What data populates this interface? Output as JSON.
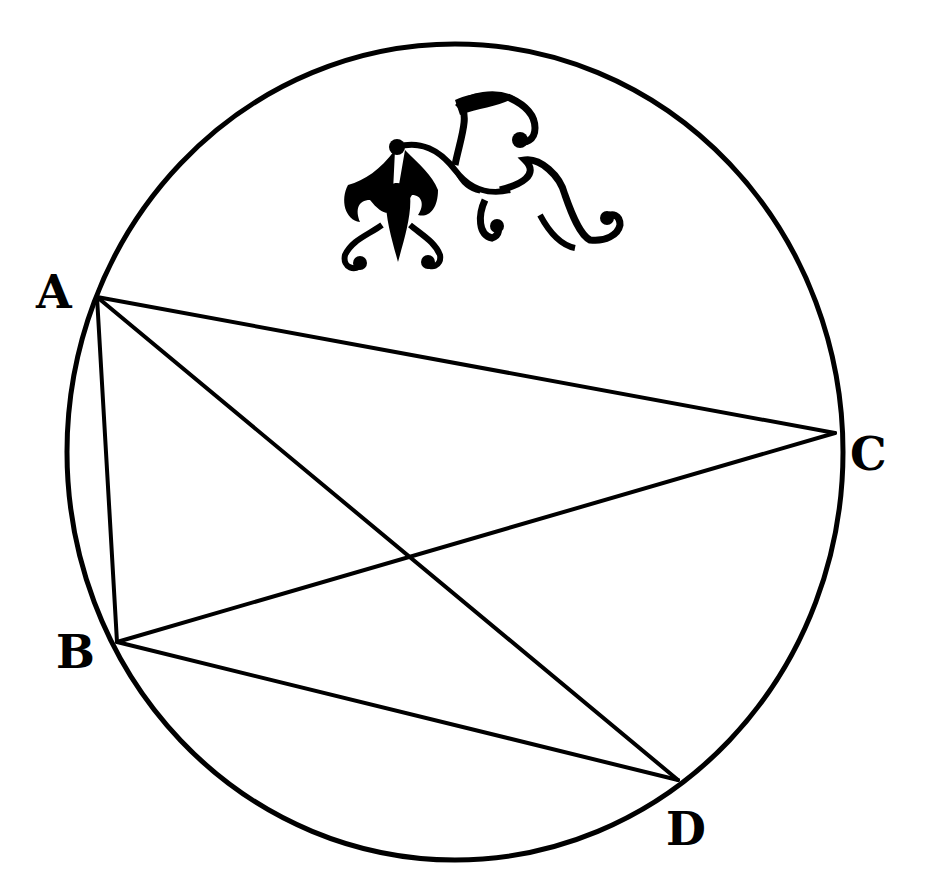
{
  "diagram": {
    "type": "cyclic-quadrilateral",
    "colors": {
      "background": "#ffffff",
      "ink": "#000000"
    },
    "circle": {
      "cx": 455,
      "cy": 452,
      "rx": 388,
      "ry": 408
    },
    "points": {
      "A": {
        "label": "A",
        "x": 97,
        "y": 297,
        "label_x": 36,
        "label_y": 308
      },
      "B": {
        "label": "B",
        "x": 117,
        "y": 642,
        "label_x": 56,
        "label_y": 668
      },
      "C": {
        "label": "C",
        "x": 835,
        "y": 433,
        "label_x": 850,
        "label_y": 470
      },
      "D": {
        "label": "D",
        "x": 678,
        "y": 780,
        "label_x": 666,
        "label_y": 845
      }
    },
    "segments": [
      {
        "name": "AC",
        "from": "A",
        "to": "C"
      },
      {
        "name": "AB",
        "from": "A",
        "to": "B"
      },
      {
        "name": "AD",
        "from": "A",
        "to": "D"
      },
      {
        "name": "BC",
        "from": "B",
        "to": "C"
      },
      {
        "name": "BD",
        "from": "B",
        "to": "D"
      }
    ],
    "ornament": {
      "name": "floral-vignette",
      "x": 335,
      "y": 90
    }
  }
}
